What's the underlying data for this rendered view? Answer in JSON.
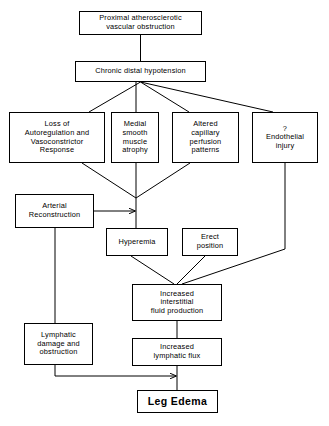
{
  "diagram": {
    "type": "flowchart",
    "canvas": {
      "width": 329,
      "height": 426
    },
    "line_color": "#000000",
    "background_color": "#ffffff",
    "nodes": [
      {
        "id": "proximal",
        "label": "Proximal atherosclerotic\nvascular  obstruction",
        "x": 79,
        "y": 11,
        "w": 123,
        "h": 24,
        "bold": false
      },
      {
        "id": "hypotension",
        "label": "Chronic distal hypotension",
        "x": 75,
        "y": 61,
        "w": 131,
        "h": 21,
        "bold": false
      },
      {
        "id": "loss",
        "label": "Loss of\nAutoregulation and\nVasoconstrictor\nResponse",
        "x": 9,
        "y": 112,
        "w": 96,
        "h": 51,
        "bold": false
      },
      {
        "id": "medial",
        "label": "Medial\nsmooth\nmuscle\natrophy",
        "x": 111,
        "y": 112,
        "w": 48,
        "h": 51,
        "bold": false
      },
      {
        "id": "altered",
        "label": "Altered\ncapillary\nperfusion\npatterns",
        "x": 172,
        "y": 112,
        "w": 67,
        "h": 51,
        "bold": false
      },
      {
        "id": "endothelial",
        "label": "?\nEndothelial\ninjury",
        "x": 252,
        "y": 112,
        "w": 66,
        "h": 51,
        "bold": false
      },
      {
        "id": "arterial",
        "label": "Arterial\nReconstruction",
        "x": 15,
        "y": 194,
        "w": 79,
        "h": 34,
        "bold": false
      },
      {
        "id": "hyperemia",
        "label": "Hyperemia",
        "x": 106,
        "y": 228,
        "w": 62,
        "h": 28,
        "bold": false
      },
      {
        "id": "erect",
        "label": "Erect\nposition",
        "x": 182,
        "y": 228,
        "w": 56,
        "h": 28,
        "bold": false
      },
      {
        "id": "interstitial",
        "label": "Increased\ninterstitial\nfluid production",
        "x": 132,
        "y": 284,
        "w": 90,
        "h": 37,
        "bold": false
      },
      {
        "id": "lymphdamage",
        "label": "Lymphatic\ndamage and\nobstruction",
        "x": 24,
        "y": 323,
        "w": 69,
        "h": 42,
        "bold": false
      },
      {
        "id": "lymphflux",
        "label": "Increased\nlymphatic flux",
        "x": 132,
        "y": 338,
        "w": 90,
        "h": 28,
        "bold": false
      },
      {
        "id": "legedema",
        "label": "Leg Edema",
        "x": 137,
        "y": 390,
        "w": 81,
        "h": 23,
        "bold": true
      }
    ],
    "edges": [
      {
        "from": "proximal",
        "to": "hypotension",
        "kind": "vertical"
      },
      {
        "from": "hypotension",
        "to": "loss",
        "kind": "branch"
      },
      {
        "from": "hypotension",
        "to": "medial",
        "kind": "branch"
      },
      {
        "from": "hypotension",
        "to": "altered",
        "kind": "branch"
      },
      {
        "from": "hypotension",
        "to": "endothelial",
        "kind": "branch"
      },
      {
        "from": "loss",
        "to": "junction",
        "kind": "diagonal"
      },
      {
        "from": "medial",
        "to": "junction",
        "kind": "vertical"
      },
      {
        "from": "altered",
        "to": "junction",
        "kind": "diagonal"
      },
      {
        "from": "arterial",
        "to": "junction",
        "kind": "arrow"
      },
      {
        "from": "junction",
        "to": "hyperemia",
        "kind": "vertical"
      },
      {
        "from": "hyperemia",
        "to": "interstitial",
        "kind": "diagonal"
      },
      {
        "from": "erect",
        "to": "interstitial",
        "kind": "diagonal"
      },
      {
        "from": "endothelial",
        "to": "interstitial",
        "kind": "elbow"
      },
      {
        "from": "interstitial",
        "to": "lymphflux",
        "kind": "vertical"
      },
      {
        "from": "arterial",
        "to": "lymphdamage",
        "kind": "vertical"
      },
      {
        "from": "lymphdamage",
        "to": "legedema",
        "kind": "elbow-arrow"
      },
      {
        "from": "lymphflux",
        "to": "legedema",
        "kind": "vertical"
      }
    ]
  }
}
